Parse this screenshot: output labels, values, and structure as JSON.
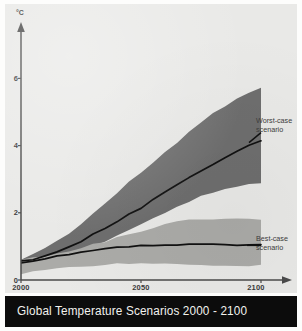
{
  "figure": {
    "title": "Global Temperature Scenarios 2000 - 2100",
    "y_axis_unit": "°C",
    "background_color": "#e9e9e7",
    "title_bar_color": "#0c0c0c",
    "title_text_color": "#f2f2ee"
  },
  "annotations": {
    "worst_line1": "Worst-case",
    "worst_line2": "scenario",
    "best_line1": "Best-case",
    "best_line2": "scenario"
  },
  "axis": {
    "y_ticks": [
      "0",
      "2",
      "4",
      "6"
    ],
    "x_ticks": [
      "2000",
      "2050",
      "2100"
    ]
  },
  "chart_data": {
    "type": "area",
    "title": "Global Temperature Scenarios 2000 - 2100",
    "xlabel": "",
    "ylabel": "°C",
    "xlim": [
      2000,
      2100
    ],
    "ylim": [
      0,
      7
    ],
    "grid": false,
    "legend_position": "inline-right",
    "x": [
      2000,
      2005,
      2010,
      2015,
      2020,
      2025,
      2030,
      2035,
      2040,
      2045,
      2050,
      2055,
      2060,
      2065,
      2070,
      2075,
      2080,
      2085,
      2090,
      2095,
      2100
    ],
    "series": [
      {
        "name": "Worst-case scenario",
        "type": "line",
        "color": "#111111",
        "values": [
          0.55,
          0.62,
          0.72,
          0.85,
          0.98,
          1.15,
          1.35,
          1.55,
          1.75,
          1.95,
          2.15,
          2.38,
          2.62,
          2.85,
          3.05,
          3.25,
          3.45,
          3.65,
          3.85,
          4.0,
          4.15
        ]
      },
      {
        "name": "Worst-case range upper",
        "type": "band-upper",
        "color": "#6e6e6e",
        "values": [
          0.62,
          0.78,
          0.95,
          1.15,
          1.4,
          1.68,
          1.98,
          2.28,
          2.58,
          2.9,
          3.2,
          3.5,
          3.8,
          4.1,
          4.4,
          4.68,
          4.95,
          5.2,
          5.42,
          5.6,
          5.75
        ]
      },
      {
        "name": "Worst-case range lower",
        "type": "band-lower",
        "color": "#6e6e6e",
        "values": [
          0.32,
          0.4,
          0.5,
          0.6,
          0.72,
          0.86,
          1.0,
          1.15,
          1.32,
          1.5,
          1.68,
          1.85,
          2.02,
          2.18,
          2.34,
          2.5,
          2.62,
          2.72,
          2.8,
          2.86,
          2.9
        ]
      },
      {
        "name": "Best-case scenario",
        "type": "line",
        "color": "#111111",
        "values": [
          0.5,
          0.56,
          0.63,
          0.7,
          0.76,
          0.82,
          0.88,
          0.93,
          0.97,
          1.0,
          1.02,
          1.04,
          1.05,
          1.06,
          1.06,
          1.06,
          1.05,
          1.04,
          1.04,
          1.03,
          1.03
        ]
      },
      {
        "name": "Best-case range upper",
        "type": "band-upper",
        "color": "#ababa8",
        "values": [
          0.6,
          0.66,
          0.73,
          0.8,
          0.88,
          0.96,
          1.05,
          1.15,
          1.25,
          1.35,
          1.45,
          1.55,
          1.64,
          1.72,
          1.78,
          1.8,
          1.8,
          1.8,
          1.8,
          1.8,
          1.8
        ]
      },
      {
        "name": "Best-case range lower",
        "type": "band-lower",
        "color": "#ababa8",
        "values": [
          0.2,
          0.24,
          0.28,
          0.32,
          0.36,
          0.4,
          0.43,
          0.45,
          0.47,
          0.48,
          0.48,
          0.48,
          0.47,
          0.46,
          0.46,
          0.45,
          0.45,
          0.44,
          0.44,
          0.44,
          0.44
        ]
      }
    ]
  }
}
